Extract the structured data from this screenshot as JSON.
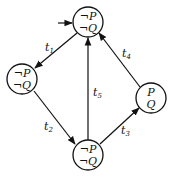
{
  "diagram": {
    "type": "state-transition-graph",
    "colors": {
      "stroke": "#111111",
      "background": "#ffffff"
    },
    "nodes": [
      {
        "id": "n0",
        "line1": "¬P",
        "line2": "¬Q",
        "x": 88,
        "y": 22,
        "initial": true
      },
      {
        "id": "n1",
        "line1": "¬P",
        "line2": "¬Q",
        "x": 22,
        "y": 79
      },
      {
        "id": "n2",
        "line1": "¬P",
        "line2": "¬Q",
        "x": 88,
        "y": 155
      },
      {
        "id": "n3",
        "line1": "P",
        "line2": "Q",
        "x": 151,
        "y": 98
      }
    ],
    "edges": [
      {
        "id": "t1",
        "label": "t",
        "sub": "1",
        "from": "n0",
        "to": "n1"
      },
      {
        "id": "t2",
        "label": "t",
        "sub": "2",
        "from": "n1",
        "to": "n2"
      },
      {
        "id": "t3",
        "label": "t",
        "sub": "3",
        "from": "n2",
        "to": "n3"
      },
      {
        "id": "t4",
        "label": "t",
        "sub": "4",
        "from": "n3",
        "to": "n0"
      },
      {
        "id": "t5",
        "label": "t",
        "sub": "5",
        "from": "n2",
        "to": "n0"
      }
    ]
  }
}
